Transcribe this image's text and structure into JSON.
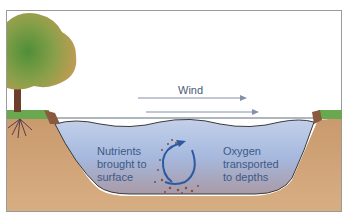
{
  "diagram": {
    "labels": {
      "wind": "Wind",
      "nutrients_line1": "Nutrients",
      "nutrients_line2": "brought to",
      "nutrients_line3": "surface",
      "oxygen_line1": "Oxygen",
      "oxygen_line2": "transported",
      "oxygen_line3": "to depths"
    },
    "colors": {
      "water": "#a9bde0",
      "soil": "#c8956a",
      "grass": "#6aa84f",
      "tree_foliage_left": "#5f9a3c",
      "tree_foliage_right": "#c9a25a",
      "trunk": "#6b3f2a",
      "text": "#3d5a86",
      "arrow": "#2c5aa0",
      "wind_arrow": "#8391a8"
    }
  }
}
